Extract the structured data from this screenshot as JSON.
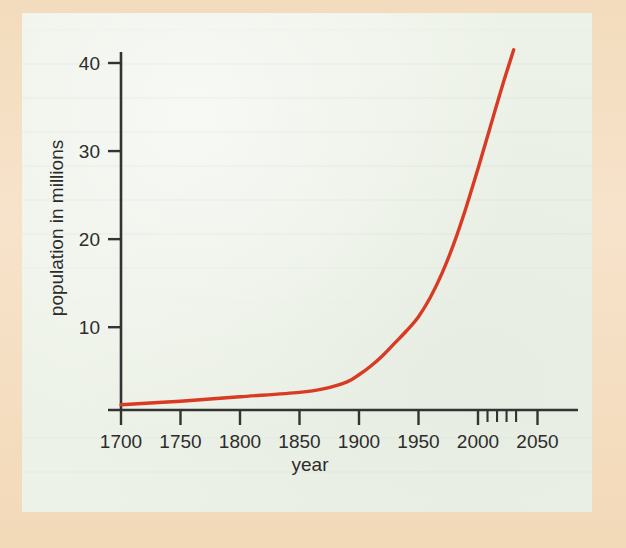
{
  "figure": {
    "background_color": "#edf2e8",
    "border_color": "#f3dcbd",
    "axis_color": "#333333",
    "curve_color": "#d93a23"
  },
  "chart_data": {
    "type": "line",
    "title": "",
    "xlabel": "year",
    "ylabel": "population in millions",
    "xlim": [
      1690,
      2060
    ],
    "ylim": [
      0,
      43
    ],
    "grid": false,
    "legend": null,
    "x_tick_labels": [
      "1700",
      "1750",
      "1800",
      "1850",
      "1900",
      "1950",
      "2000",
      "2050"
    ],
    "x_ticks": [
      1700,
      1750,
      1800,
      1850,
      1900,
      1950,
      2000,
      2050
    ],
    "x_minor_ticks": [
      2008,
      2016,
      2024,
      2032
    ],
    "y_tick_labels": [
      "10",
      "20",
      "30",
      "40"
    ],
    "y_ticks": [
      10,
      20,
      30,
      40
    ],
    "series": [
      {
        "name": "population",
        "color": "#d93a23",
        "x": [
          1700,
          1750,
          1800,
          1850,
          1870,
          1890,
          1900,
          1910,
          1920,
          1930,
          1940,
          1950,
          1960,
          1970,
          1980,
          1990,
          2000,
          2010,
          2020,
          2030
        ],
        "values": [
          1.2,
          1.6,
          2.1,
          2.6,
          3.0,
          3.8,
          4.6,
          5.6,
          6.8,
          8.2,
          9.6,
          11.2,
          13.4,
          16.2,
          19.6,
          23.6,
          28.0,
          32.6,
          37.2,
          41.5
        ]
      }
    ]
  },
  "labels": {
    "x_axis_title": "year",
    "y_axis_title": "population in millions"
  }
}
